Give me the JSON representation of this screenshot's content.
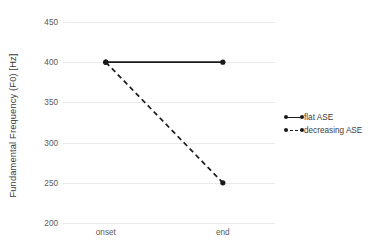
{
  "chart_data": {
    "type": "line",
    "title": "",
    "xlabel": "",
    "ylabel": "Fundamental Frequency (F0) [Hz]",
    "categories": [
      "onset",
      "end"
    ],
    "x_tick_labels": [
      "onset",
      "end"
    ],
    "y_tick_labels": [
      "200",
      "250",
      "300",
      "350",
      "400",
      "450"
    ],
    "y_ticks": [
      200,
      250,
      300,
      350,
      400,
      450
    ],
    "ylim": [
      200,
      450
    ],
    "grid": "horizontal",
    "legend_position": "right",
    "series": [
      {
        "name": "flat ASE",
        "values": [
          400,
          400
        ],
        "linestyle": "solid",
        "marker": "circle",
        "color": "#1a1a1a"
      },
      {
        "name": "decreasing ASE",
        "values": [
          400,
          250
        ],
        "linestyle": "dashed",
        "marker": "circle",
        "color": "#1a1a1a"
      }
    ]
  },
  "legend": {
    "entries": [
      {
        "label": "flat ASE",
        "style": "solid"
      },
      {
        "label": "decreasing ASE",
        "style": "dashed"
      }
    ]
  },
  "colors": {
    "line": "#1a1a1a",
    "grid": "#ebebeb",
    "tick_text": "#595959",
    "axis_title": "#3a3a3a",
    "background": "#ffffff"
  }
}
